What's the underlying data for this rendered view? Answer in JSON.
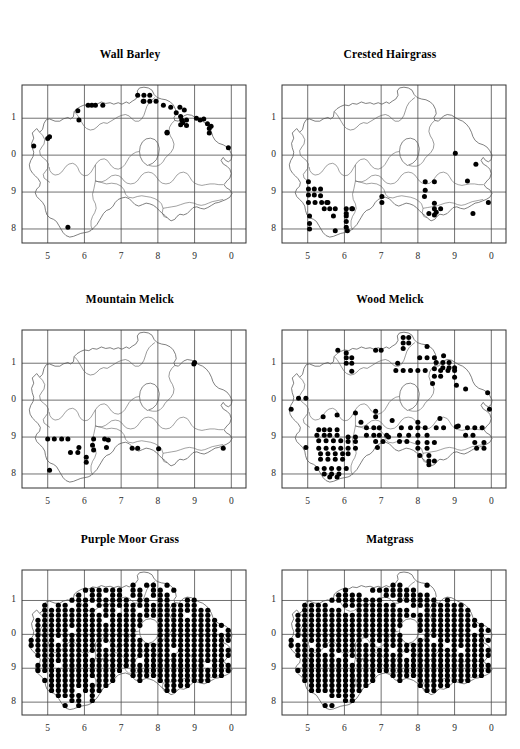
{
  "figure": {
    "type": "distribution-map-grid",
    "rows": 3,
    "cols": 2,
    "background": "#ffffff",
    "ink": "#000000",
    "grid_color": "#4d4d4d",
    "coast_color": "#555555"
  },
  "axes": {
    "x_ticks": [
      "5",
      "6",
      "7",
      "8",
      "9",
      "0"
    ],
    "y_ticks": [
      "1",
      "0",
      "9",
      "8"
    ],
    "xlabel": "",
    "ylabel": ""
  },
  "chart_data": {
    "type": "scatter",
    "xlabel": "",
    "ylabel": "",
    "xlim": [
      4.3,
      10.4
    ],
    "ylim": [
      7.6,
      11.9
    ],
    "grid": true,
    "legend": "none",
    "x_tick_values": [
      5,
      6,
      7,
      8,
      9,
      10
    ],
    "x_tick_labels": [
      "5",
      "6",
      "7",
      "8",
      "9",
      "0"
    ],
    "y_tick_values": [
      11,
      10,
      9,
      8
    ],
    "y_tick_labels": [
      "1",
      "0",
      "9",
      "8"
    ],
    "marker": "filled-circle",
    "panels": [
      {
        "id": "wall-barley",
        "title": "Wall Barley",
        "row": 0,
        "col": 0,
        "n_points": 38,
        "points": [
          [
            7.45,
            11.62
          ],
          [
            7.62,
            11.62
          ],
          [
            7.78,
            11.62
          ],
          [
            7.62,
            11.46
          ],
          [
            7.78,
            11.46
          ],
          [
            7.95,
            11.46
          ],
          [
            6.1,
            11.35
          ],
          [
            6.3,
            11.35
          ],
          [
            6.5,
            11.35
          ],
          [
            5.82,
            11.2
          ],
          [
            8.15,
            11.35
          ],
          [
            8.35,
            11.3
          ],
          [
            8.6,
            11.3
          ],
          [
            8.5,
            11.15
          ],
          [
            8.62,
            11.05
          ],
          [
            8.65,
            10.95
          ],
          [
            8.78,
            10.95
          ],
          [
            9.05,
            11.0
          ],
          [
            9.25,
            10.98
          ],
          [
            8.62,
            10.82
          ],
          [
            8.78,
            10.8
          ],
          [
            9.35,
            10.85
          ],
          [
            9.4,
            10.72
          ],
          [
            9.4,
            10.6
          ],
          [
            5.85,
            10.95
          ],
          [
            8.25,
            10.62
          ],
          [
            5.05,
            10.5
          ],
          [
            4.62,
            10.25
          ],
          [
            9.92,
            10.2
          ],
          [
            7.6,
            11.46
          ],
          [
            6.2,
            11.35
          ],
          [
            8.72,
            11.22
          ],
          [
            8.68,
            10.88
          ],
          [
            9.15,
            10.95
          ],
          [
            9.45,
            10.78
          ],
          [
            5.0,
            10.45
          ],
          [
            5.55,
            8.05
          ],
          [
            8.25,
            10.6
          ]
        ]
      },
      {
        "id": "crested-hairgrass",
        "title": "Crested Hairgrass",
        "row": 0,
        "col": 1,
        "n_points": 45,
        "points": [
          [
            5.02,
            9.28
          ],
          [
            5.02,
            9.08
          ],
          [
            5.18,
            9.08
          ],
          [
            5.35,
            9.08
          ],
          [
            5.02,
            8.92
          ],
          [
            5.18,
            8.92
          ],
          [
            5.02,
            8.72
          ],
          [
            5.2,
            8.72
          ],
          [
            5.38,
            8.72
          ],
          [
            5.55,
            8.72
          ],
          [
            5.45,
            8.55
          ],
          [
            5.6,
            8.55
          ],
          [
            5.75,
            8.55
          ],
          [
            6.05,
            8.55
          ],
          [
            6.2,
            8.55
          ],
          [
            5.05,
            8.35
          ],
          [
            5.7,
            8.35
          ],
          [
            6.05,
            8.35
          ],
          [
            6.05,
            8.2
          ],
          [
            5.05,
            8.15
          ],
          [
            5.05,
            8.0
          ],
          [
            5.75,
            7.95
          ],
          [
            6.05,
            8.05
          ],
          [
            6.08,
            7.95
          ],
          [
            7.02,
            8.88
          ],
          [
            7.02,
            8.72
          ],
          [
            8.2,
            9.28
          ],
          [
            8.45,
            9.28
          ],
          [
            8.2,
            9.05
          ],
          [
            8.18,
            8.88
          ],
          [
            8.45,
            8.7
          ],
          [
            8.45,
            8.55
          ],
          [
            8.62,
            8.55
          ],
          [
            8.45,
            8.38
          ],
          [
            9.02,
            10.05
          ],
          [
            9.58,
            9.75
          ],
          [
            9.35,
            9.3
          ],
          [
            9.92,
            8.72
          ],
          [
            9.5,
            8.42
          ],
          [
            5.35,
            8.9
          ],
          [
            5.52,
            8.72
          ],
          [
            6.05,
            8.42
          ],
          [
            6.22,
            8.55
          ],
          [
            8.3,
            8.42
          ],
          [
            8.5,
            8.45
          ]
        ]
      },
      {
        "id": "mountain-melick",
        "title": "Mountain Melick",
        "row": 1,
        "col": 0,
        "n_points": 22,
        "points": [
          [
            9.0,
            11.02
          ],
          [
            8.98,
            10.98
          ],
          [
            5.0,
            8.95
          ],
          [
            5.18,
            8.95
          ],
          [
            5.38,
            8.95
          ],
          [
            5.55,
            8.95
          ],
          [
            6.25,
            8.95
          ],
          [
            6.55,
            8.95
          ],
          [
            6.65,
            8.92
          ],
          [
            5.85,
            8.72
          ],
          [
            6.22,
            8.78
          ],
          [
            6.25,
            8.65
          ],
          [
            5.62,
            8.58
          ],
          [
            5.82,
            8.58
          ],
          [
            6.05,
            8.45
          ],
          [
            6.05,
            8.32
          ],
          [
            6.6,
            8.72
          ],
          [
            7.3,
            8.7
          ],
          [
            7.45,
            8.7
          ],
          [
            8.02,
            8.68
          ],
          [
            9.78,
            8.7
          ],
          [
            5.05,
            8.1
          ]
        ]
      },
      {
        "id": "wood-melick",
        "title": "Wood Melick",
        "row": 1,
        "col": 1,
        "n_points": 140,
        "points": [
          [
            7.6,
            11.7
          ],
          [
            7.75,
            11.7
          ],
          [
            7.6,
            11.55
          ],
          [
            7.75,
            11.55
          ],
          [
            7.6,
            11.4
          ],
          [
            8.25,
            11.45
          ],
          [
            5.82,
            11.35
          ],
          [
            6.05,
            11.28
          ],
          [
            6.85,
            11.35
          ],
          [
            7.0,
            11.35
          ],
          [
            6.05,
            11.15
          ],
          [
            6.2,
            11.15
          ],
          [
            8.05,
            11.15
          ],
          [
            8.25,
            11.15
          ],
          [
            8.45,
            11.15
          ],
          [
            8.7,
            11.2
          ],
          [
            6.05,
            11.0
          ],
          [
            6.2,
            11.0
          ],
          [
            7.45,
            11.0
          ],
          [
            8.5,
            11.02
          ],
          [
            8.68,
            11.02
          ],
          [
            8.85,
            11.02
          ],
          [
            8.68,
            10.88
          ],
          [
            8.85,
            10.88
          ],
          [
            9.0,
            10.88
          ],
          [
            7.4,
            10.8
          ],
          [
            7.6,
            10.8
          ],
          [
            7.8,
            10.8
          ],
          [
            8.0,
            10.8
          ],
          [
            8.2,
            10.8
          ],
          [
            8.45,
            10.85
          ],
          [
            8.62,
            10.8
          ],
          [
            8.82,
            10.8
          ],
          [
            9.0,
            10.8
          ],
          [
            6.2,
            10.78
          ],
          [
            8.45,
            10.65
          ],
          [
            8.62,
            10.65
          ],
          [
            9.0,
            10.62
          ],
          [
            8.4,
            10.45
          ],
          [
            9.05,
            10.4
          ],
          [
            4.75,
            10.05
          ],
          [
            4.95,
            10.05
          ],
          [
            9.3,
            10.3
          ],
          [
            9.9,
            10.2
          ],
          [
            4.55,
            9.75
          ],
          [
            9.95,
            9.75
          ],
          [
            6.3,
            9.65
          ],
          [
            6.85,
            9.7
          ],
          [
            6.85,
            9.55
          ],
          [
            5.42,
            9.55
          ],
          [
            5.8,
            9.6
          ],
          [
            7.3,
            9.45
          ],
          [
            8.6,
            9.5
          ],
          [
            5.3,
            9.2
          ],
          [
            5.45,
            9.2
          ],
          [
            5.6,
            9.2
          ],
          [
            5.8,
            9.2
          ],
          [
            6.6,
            9.25
          ],
          [
            6.8,
            9.25
          ],
          [
            6.95,
            9.25
          ],
          [
            7.55,
            9.25
          ],
          [
            7.8,
            9.25
          ],
          [
            8.0,
            9.25
          ],
          [
            8.2,
            9.25
          ],
          [
            8.5,
            9.25
          ],
          [
            8.7,
            9.25
          ],
          [
            9.05,
            9.28
          ],
          [
            9.35,
            9.25
          ],
          [
            9.55,
            9.25
          ],
          [
            5.25,
            9.05
          ],
          [
            5.45,
            9.05
          ],
          [
            5.6,
            9.05
          ],
          [
            5.8,
            9.05
          ],
          [
            6.6,
            9.05
          ],
          [
            6.8,
            9.05
          ],
          [
            6.95,
            9.05
          ],
          [
            7.15,
            9.05
          ],
          [
            7.5,
            9.05
          ],
          [
            7.75,
            9.05
          ],
          [
            8.0,
            9.05
          ],
          [
            8.25,
            9.05
          ],
          [
            9.3,
            9.05
          ],
          [
            9.5,
            9.05
          ],
          [
            6.1,
            9.0
          ],
          [
            6.3,
            9.0
          ],
          [
            5.3,
            8.9
          ],
          [
            5.5,
            8.9
          ],
          [
            5.7,
            8.9
          ],
          [
            5.9,
            8.9
          ],
          [
            6.1,
            8.88
          ],
          [
            6.3,
            8.88
          ],
          [
            6.85,
            8.88
          ],
          [
            7.05,
            8.88
          ],
          [
            7.5,
            8.88
          ],
          [
            7.7,
            8.88
          ],
          [
            8.0,
            8.85
          ],
          [
            8.25,
            8.85
          ],
          [
            8.45,
            8.85
          ],
          [
            9.55,
            8.85
          ],
          [
            9.8,
            8.85
          ],
          [
            4.95,
            8.72
          ],
          [
            5.3,
            8.7
          ],
          [
            5.5,
            8.7
          ],
          [
            5.7,
            8.7
          ],
          [
            5.9,
            8.7
          ],
          [
            6.1,
            8.7
          ],
          [
            6.3,
            8.7
          ],
          [
            6.9,
            8.72
          ],
          [
            8.0,
            8.7
          ],
          [
            8.25,
            8.7
          ],
          [
            9.6,
            8.7
          ],
          [
            9.8,
            8.7
          ],
          [
            5.35,
            8.55
          ],
          [
            5.55,
            8.55
          ],
          [
            5.75,
            8.55
          ],
          [
            5.95,
            8.55
          ],
          [
            6.1,
            8.55
          ],
          [
            8.05,
            8.5
          ],
          [
            8.3,
            8.5
          ],
          [
            5.35,
            8.4
          ],
          [
            5.55,
            8.4
          ],
          [
            5.75,
            8.4
          ],
          [
            5.95,
            8.4
          ],
          [
            8.3,
            8.35
          ],
          [
            8.45,
            8.35
          ],
          [
            5.25,
            8.15
          ],
          [
            5.45,
            8.15
          ],
          [
            5.65,
            8.15
          ],
          [
            5.85,
            8.15
          ],
          [
            6.05,
            8.15
          ],
          [
            5.45,
            8.0
          ],
          [
            5.65,
            8.0
          ],
          [
            5.85,
            8.0
          ],
          [
            5.6,
            7.92
          ],
          [
            5.8,
            7.92
          ],
          [
            8.3,
            8.25
          ],
          [
            9.1,
            9.3
          ],
          [
            6.45,
            9.4
          ],
          [
            7.2,
            9.0
          ],
          [
            8.0,
            9.4
          ],
          [
            9.75,
            9.25
          ]
        ]
      },
      {
        "id": "purple-moor-grass",
        "title": "Purple Moor Grass",
        "row": 2,
        "col": 0,
        "n_points": 255,
        "grid_fill": {
          "x_start": 4.55,
          "x_step": 0.2,
          "y_start": 7.85,
          "y_step": 0.155,
          "description": "near-complete 10-km square coverage across Northern Ireland"
        }
      },
      {
        "id": "matgrass",
        "title": "Matgrass",
        "row": 2,
        "col": 1,
        "n_points": 250,
        "grid_fill": {
          "x_start": 4.55,
          "x_step": 0.2,
          "y_start": 7.85,
          "y_step": 0.155,
          "description": "near-complete 10-km square coverage across Northern Ireland"
        }
      }
    ]
  }
}
